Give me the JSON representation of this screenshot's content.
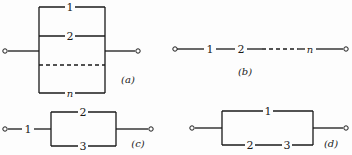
{
  "diagrams": {
    "a": {
      "caption": "(a)",
      "type": "parallel",
      "components": [
        "1",
        "2",
        "n"
      ],
      "ellipsis": "dashed branch"
    },
    "b": {
      "caption": "(b)",
      "type": "series",
      "components": [
        "1",
        "2",
        "n"
      ],
      "ellipsis": "dashed segment"
    },
    "c": {
      "caption": "(c)",
      "type": "series-parallel",
      "components": [
        "1",
        "2",
        "3"
      ]
    },
    "d": {
      "caption": "(d)",
      "type": "parallel-series",
      "components": [
        "1",
        "2",
        "3"
      ]
    }
  }
}
